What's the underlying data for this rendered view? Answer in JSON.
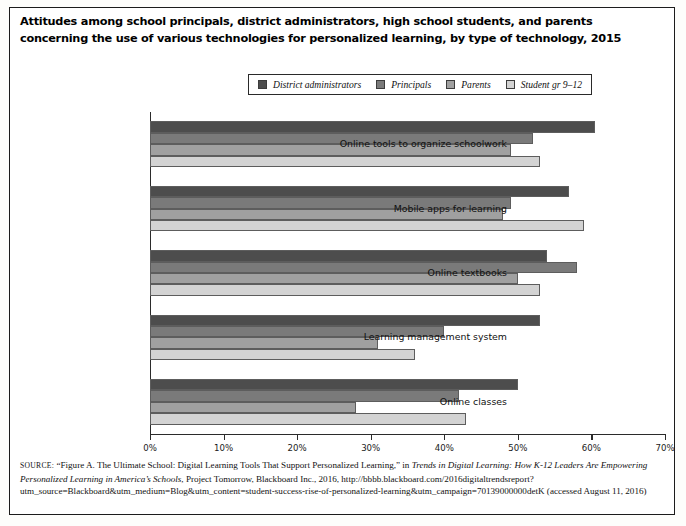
{
  "title": "Attitudes among school principals, district administrators, high school students, and parents concerning the use of various technologies for personalized learning, by type of technology, 2015",
  "legend": {
    "position": "top-center",
    "items": [
      {
        "label": "District administrators",
        "color": "#4d4d4d"
      },
      {
        "label": "Principals",
        "color": "#7a7a7a"
      },
      {
        "label": "Parents",
        "color": "#a0a0a0"
      },
      {
        "label": "Student gr 9–12",
        "color": "#d3d3d3"
      }
    ]
  },
  "source": {
    "prefix": "SOURCE:",
    "line1_a": "“Figure A. The Ultimate School: Digital Learning Tools That Support Personalized Learning,” in ",
    "line1_italic": "Trends in Digital Learning: How K-12 Leaders Are Empowering Personalized Learning in America’s Schools",
    "line2": ", Project Tomorrow, Blackboard Inc., 2016, http://bbbb.blackboard.com/2016digitaltrendsreport?utm_source=Blackboard&utm_medium=Blog&utm_content=student-success-rise-of-personalized-learning&utm_campaign=70139000000detK (accessed August 11, 2016)"
  },
  "chart_data": {
    "type": "bar",
    "orientation": "horizontal",
    "title": "Attitudes among school principals, district administrators, high school students, and parents concerning the use of various technologies for personalized learning, by type of technology, 2015",
    "xlabel": "",
    "ylabel": "",
    "xlim": [
      0,
      70
    ],
    "xticks": [
      "0%",
      "10%",
      "20%",
      "30%",
      "40%",
      "50%",
      "60%",
      "70%"
    ],
    "xtick_values": [
      0,
      10,
      20,
      30,
      40,
      50,
      60,
      70
    ],
    "grid": false,
    "legend_position": "top-center",
    "categories": [
      "Online tools to organize schoolwork",
      "Mobile apps for learning",
      "Online textbooks",
      "Learning management system",
      "Online classes"
    ],
    "series": [
      {
        "name": "District administrators",
        "color": "#4d4d4d",
        "values": [
          60.5,
          57.0,
          54.0,
          53.0,
          50.0
        ]
      },
      {
        "name": "Principals",
        "color": "#7a7a7a",
        "values": [
          52.0,
          49.0,
          58.0,
          40.0,
          42.0
        ]
      },
      {
        "name": "Parents",
        "color": "#a0a0a0",
        "values": [
          49.0,
          48.0,
          50.0,
          31.0,
          28.0
        ]
      },
      {
        "name": "Student gr 9–12",
        "color": "#d3d3d3",
        "values": [
          53.0,
          59.0,
          53.0,
          36.0,
          43.0
        ]
      }
    ]
  }
}
